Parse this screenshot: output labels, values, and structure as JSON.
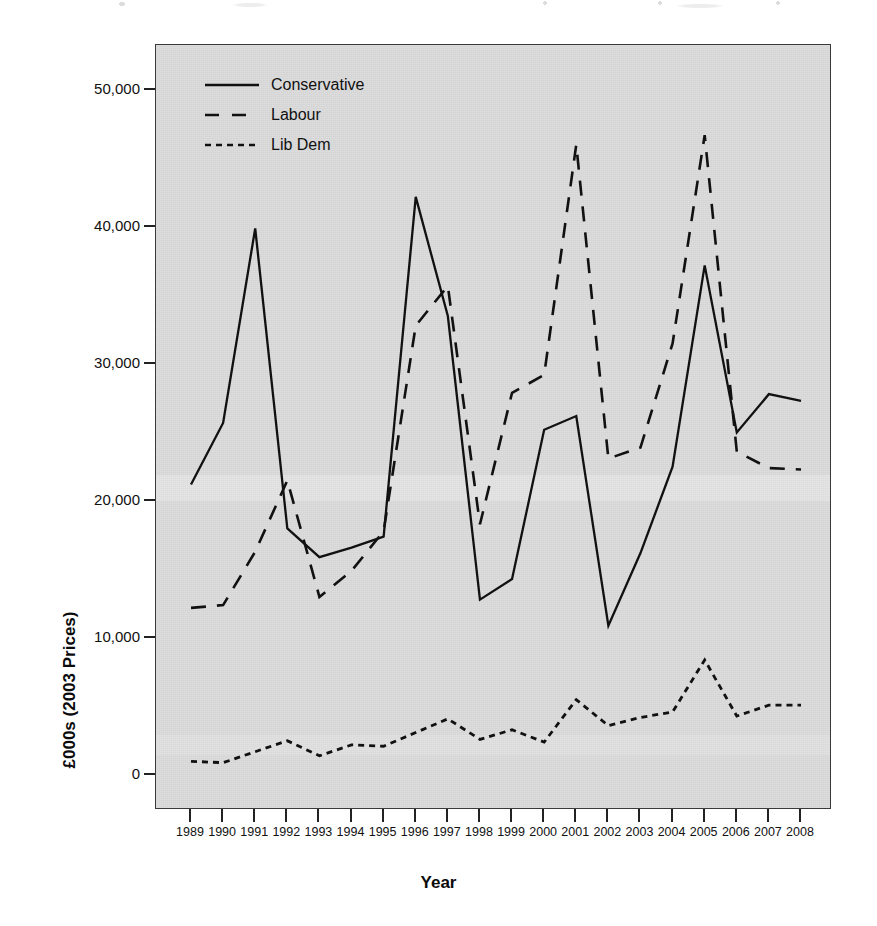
{
  "chart_data": {
    "type": "line",
    "title": "",
    "xlabel": "Year",
    "ylabel": "£000s (2003 Prices)",
    "x": [
      1989,
      1990,
      1991,
      1992,
      1993,
      1994,
      1995,
      1996,
      1997,
      1998,
      1999,
      2000,
      2001,
      2002,
      2003,
      2004,
      2005,
      2006,
      2007,
      2008
    ],
    "categories": [
      "1989",
      "1990",
      "1991",
      "1992",
      "1993",
      "1994",
      "1995",
      "1996",
      "1997",
      "1998",
      "1999",
      "2000",
      "2001",
      "2002",
      "2003",
      "2004",
      "2005",
      "2006",
      "2007",
      "2008"
    ],
    "xlim": [
      1989,
      2008
    ],
    "ylim": [
      0,
      52000
    ],
    "yticks": [
      0,
      10000,
      20000,
      30000,
      40000,
      50000
    ],
    "ytick_labels": [
      "0",
      "10,000",
      "20,000",
      "30,000",
      "40,000",
      "50,000"
    ],
    "grid": false,
    "legend_position": "top-left",
    "series": [
      {
        "name": "Conservative",
        "style": "solid",
        "values": [
          21200,
          25700,
          39900,
          18000,
          15900,
          16600,
          17400,
          42200,
          33500,
          12800,
          14300,
          25200,
          26200,
          10900,
          16200,
          22500,
          37200,
          25000,
          27800,
          27300
        ]
      },
      {
        "name": "Labour",
        "style": "dashed",
        "values": [
          12200,
          12400,
          16300,
          21500,
          13000,
          14900,
          17800,
          32800,
          35700,
          18300,
          27900,
          29200,
          46000,
          23100,
          23900,
          31500,
          46700,
          23600,
          22400,
          22300
        ]
      },
      {
        "name": "Lib Dem",
        "style": "dotted",
        "values": [
          1000,
          900,
          1700,
          2500,
          1400,
          2200,
          2100,
          3100,
          4100,
          2600,
          3300,
          2400,
          5500,
          3600,
          4200,
          4600,
          8400,
          4300,
          5100,
          5100
        ]
      }
    ]
  },
  "legend": [
    {
      "label": "Conservative",
      "style": "solid"
    },
    {
      "label": "Labour",
      "style": "dashed"
    },
    {
      "label": "Lib Dem",
      "style": "dotted"
    }
  ],
  "axes": {
    "y_label": "£000s (2003 Prices)",
    "x_label": "Year",
    "y_ticks": [
      "50,000",
      "40,000",
      "30,000",
      "20,000",
      "10,000",
      "0"
    ],
    "x_ticks": [
      "1989",
      "1990",
      "1991",
      "1992",
      "1993",
      "1994",
      "1995",
      "1996",
      "1997",
      "1998",
      "1999",
      "2000",
      "2001",
      "2002",
      "2003",
      "2004",
      "2005",
      "2006",
      "2007",
      "2008"
    ]
  },
  "colors": {
    "panel_background": "#dcdcdc",
    "line": "#111111",
    "axis": "#222222",
    "text": "#111111"
  }
}
